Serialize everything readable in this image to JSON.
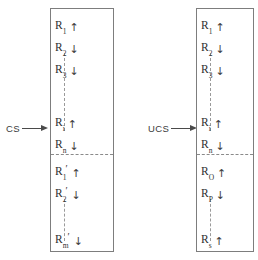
{
  "figure": {
    "type": "diagram"
  },
  "stimuli": [
    {
      "id": "cs",
      "label": "CS",
      "arrow": "right-arrow",
      "points_to": "column-cs"
    },
    {
      "id": "ucs",
      "label": "UCS",
      "arrow": "right-arrow",
      "points_to": "column-ucs"
    }
  ],
  "columns": [
    {
      "id": "column-cs",
      "stimulus": "CS",
      "sections": [
        {
          "id": "cs-upper",
          "items": [
            {
              "base": "R",
              "sub": "1",
              "prime": false,
              "direction": "up"
            },
            {
              "base": "R",
              "sub": "2",
              "prime": false,
              "direction": "down"
            },
            {
              "base": "R",
              "sub": "3",
              "prime": false,
              "direction": "down"
            },
            {
              "base": "R",
              "sub": "i",
              "prime": false,
              "direction": "up"
            },
            {
              "base": "R",
              "sub": "n",
              "prime": false,
              "direction": "down"
            }
          ],
          "continuation": "vertical-dashed-line"
        },
        {
          "id": "cs-lower",
          "items": [
            {
              "base": "R",
              "sub": "1",
              "prime": true,
              "direction": "up"
            },
            {
              "base": "R",
              "sub": "2",
              "prime": true,
              "direction": "down"
            },
            {
              "base": "R",
              "sub": "m",
              "prime": true,
              "direction": "down"
            }
          ],
          "continuation": "vertical-dashed-line"
        }
      ],
      "section_divider": "horizontal-dashed-line"
    },
    {
      "id": "column-ucs",
      "stimulus": "UCS",
      "sections": [
        {
          "id": "ucs-upper",
          "items": [
            {
              "base": "R",
              "sub": "1",
              "prime": false,
              "direction": "up"
            },
            {
              "base": "R",
              "sub": "2",
              "prime": false,
              "direction": "down"
            },
            {
              "base": "R",
              "sub": "3",
              "prime": false,
              "direction": "down"
            },
            {
              "base": "R",
              "sub": "i",
              "prime": false,
              "direction": "up"
            },
            {
              "base": "R",
              "sub": "n",
              "prime": false,
              "direction": "down"
            }
          ],
          "continuation": "vertical-dashed-line"
        },
        {
          "id": "ucs-lower",
          "items": [
            {
              "base": "R",
              "sub": "O",
              "prime": false,
              "direction": "up"
            },
            {
              "base": "R",
              "sub": "P",
              "prime": false,
              "direction": "down"
            },
            {
              "base": "R",
              "sub": "s",
              "prime": false,
              "direction": "up"
            }
          ],
          "continuation": "vertical-dashed-line"
        }
      ],
      "section_divider": "horizontal-dashed-line"
    }
  ],
  "glyphs": {
    "up": "↑",
    "down": "↓"
  },
  "colors": {
    "ink": "#2f2f2f",
    "rule": "#7d7d7d",
    "dash": "#9a9a9a",
    "background": "#ffffff"
  }
}
